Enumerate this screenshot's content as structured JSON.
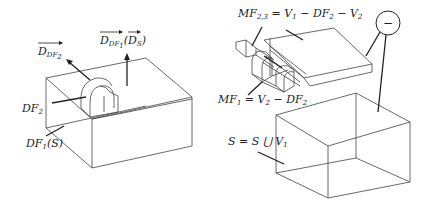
{
  "left_figure": {
    "labels": {
      "d_df2": "D",
      "d_df2_sub": "DF",
      "d_df2_subsub": "2",
      "d_df1": "D",
      "d_df1_sub": "DF",
      "d_df1_subsub": "1",
      "d_s_paren_open": "(",
      "d_s": "D",
      "d_s_sub": "S",
      "d_s_paren_close": ")",
      "df2": "DF",
      "df2_sub": "2",
      "df1s": "DF",
      "df1s_sub": "1",
      "df1s_tail": "(S)"
    }
  },
  "right_figure": {
    "labels": {
      "mf23_head": "MF",
      "mf23_sub": "2,3",
      "mf23_tail": " = V",
      "mf23_v1_sub": "1",
      "mf23_mid": " − DF",
      "mf23_df2_sub": "2",
      "mf23_end": " − V",
      "mf23_v2_sub": "2",
      "mf1_head": "MF",
      "mf1_sub": "1",
      "mf1_tail": " = V",
      "mf1_v2_sub": "2",
      "mf1_end": " − DF",
      "mf1_df2_sub": "2",
      "s_eq": "S = S ⋃ V",
      "s_eq_sub": "1",
      "minus_symbol": "−"
    }
  }
}
